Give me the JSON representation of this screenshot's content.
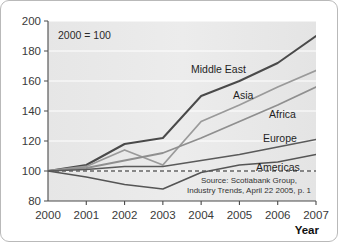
{
  "annotation": "2000 = 100",
  "axis_title": "Year",
  "source": {
    "line1": "Source: Scotiabank Group,",
    "line2": "Industry Trends, April 22 2005, p. 1"
  },
  "colors": {
    "middle_east": "#4a4a4a",
    "asia": "#9a9a9a",
    "africa": "#8f8f8f",
    "europe": "#5a5a5a",
    "americas": "#555555",
    "plot_background": "#ebebeb",
    "gridline": "#ffffff",
    "axis": "#4a4a4a",
    "baseline": "#1a1a1a",
    "border": "#b9b9b9"
  },
  "chart_data": {
    "type": "line",
    "title": "",
    "subtitle": "",
    "xlabel": "Year",
    "ylabel": "",
    "annotation": "2000 = 100",
    "grid": true,
    "legend_position": "inline-labels",
    "x": [
      2000,
      2001,
      2002,
      2003,
      2004,
      2005,
      2006,
      2007
    ],
    "xlim": [
      2000,
      2007
    ],
    "ylim": [
      80,
      200
    ],
    "y_ticks": [
      80,
      100,
      120,
      140,
      160,
      180,
      200
    ],
    "x_tick_labels": [
      "2000",
      "2001",
      "2002",
      "2003",
      "2004",
      "2005",
      "2006",
      "2007"
    ],
    "baseline_value": 100,
    "series": [
      {
        "name": "Middle East",
        "values": [
          100,
          104,
          118,
          122,
          150,
          160,
          172,
          190
        ]
      },
      {
        "name": "Asia",
        "values": [
          100,
          103,
          114,
          104,
          133,
          144,
          156,
          167
        ]
      },
      {
        "name": "Africa",
        "values": [
          100,
          102,
          107,
          112,
          122,
          133,
          144,
          156
        ]
      },
      {
        "name": "Europe",
        "values": [
          100,
          101,
          103,
          103,
          107,
          111,
          116,
          121
        ]
      },
      {
        "name": "Americas",
        "values": [
          100,
          96,
          91,
          88,
          99,
          104,
          106,
          111
        ]
      }
    ]
  },
  "series_labels": [
    {
      "name": "Middle East"
    },
    {
      "name": "Asia"
    },
    {
      "name": "Africa"
    },
    {
      "name": "Europe"
    },
    {
      "name": "Americas"
    }
  ]
}
